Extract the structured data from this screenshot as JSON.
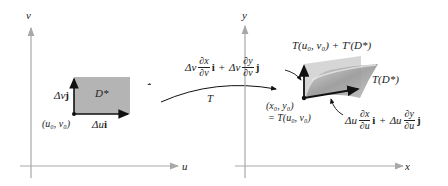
{
  "diagram": {
    "left_panel": {
      "axes": {
        "horizontal_label": "u",
        "vertical_label": "v"
      },
      "region_label": "D*",
      "corner_point_label": "(u₀, v₀)",
      "vertical_vector_label": {
        "delta": "Δv",
        "unit": "j"
      },
      "horizontal_vector_label": {
        "delta": "Δu",
        "unit": "i"
      }
    },
    "mapping": {
      "label": "T"
    },
    "right_panel": {
      "axes": {
        "horizontal_label": "x",
        "vertical_label": "y"
      },
      "image_region_label": "T(D*)",
      "parallelogram_label": "T(u₀, v₀) + T′(D*)",
      "base_point_label_line1": "(x₀, y₀)",
      "base_point_label_line2": "= T(u₀, v₀)",
      "v_vector_label": {
        "term1_delta": "Δv",
        "term1_num": "∂x",
        "term1_den": "∂v",
        "term1_unit": "i",
        "plus": "+",
        "term2_delta": "Δv",
        "term2_num": "∂y",
        "term2_den": "∂v",
        "term2_unit": "j"
      },
      "u_vector_label": {
        "term1_delta": "Δu",
        "term1_num": "∂x",
        "term1_den": "∂u",
        "term1_unit": "i",
        "plus": "+",
        "term2_delta": "Δu",
        "term2_num": "∂y",
        "term2_den": "∂u",
        "term2_unit": "j"
      }
    },
    "colors": {
      "axis": "#a8a8a8",
      "region_fill": "#b4b4b4",
      "vector": "#111111",
      "surface_light": "#c9c9c9",
      "surface_dark": "#8e8e8e"
    }
  }
}
